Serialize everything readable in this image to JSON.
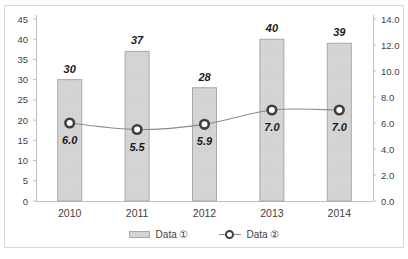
{
  "chart_data": {
    "type": "bar",
    "subtype": "bar-line-combo",
    "title": "",
    "categories": [
      "2010",
      "2011",
      "2012",
      "2013",
      "2014"
    ],
    "series": [
      {
        "name": "Data ①",
        "type": "bar",
        "axis": "left",
        "values": [
          30,
          37,
          28,
          40,
          39
        ],
        "labels": [
          "30",
          "37",
          "28",
          "40",
          "39"
        ]
      },
      {
        "name": "Data ②",
        "type": "line",
        "axis": "right",
        "values": [
          6.0,
          5.5,
          5.9,
          7.0,
          7.0
        ],
        "labels": [
          "6.0",
          "5.5",
          "5.9",
          "7.0",
          "7.0"
        ]
      }
    ],
    "left_axis": {
      "min": 0,
      "max": 45,
      "step": 5,
      "ticks": [
        "0",
        "5",
        "10",
        "15",
        "20",
        "25",
        "30",
        "35",
        "40",
        "45"
      ]
    },
    "right_axis": {
      "min": 0,
      "max": 14,
      "step": 2,
      "ticks": [
        "0.0",
        "2.0",
        "4.0",
        "6.0",
        "8.0",
        "10.0",
        "12.0",
        "14.0"
      ]
    },
    "legend": [
      {
        "label": "Data ①",
        "swatch": "bar"
      },
      {
        "label": "Data ②",
        "swatch": "line-marker"
      }
    ],
    "grid": "off",
    "legend_position": "bottom-center",
    "colors": {
      "bar_fill": "#d6d6d6",
      "bar_dot": "#c3c3c3",
      "bar_stroke": "#a9a9a9",
      "axis_line": "#bfbfbf",
      "tick_label": "#3f3f3f",
      "data_label": "#1a1a1a",
      "line": "#8c8c8c",
      "marker_ring": "#3f3f3f",
      "marker_fill": "#ffffff",
      "frame_border": "#d8d8d8"
    }
  }
}
